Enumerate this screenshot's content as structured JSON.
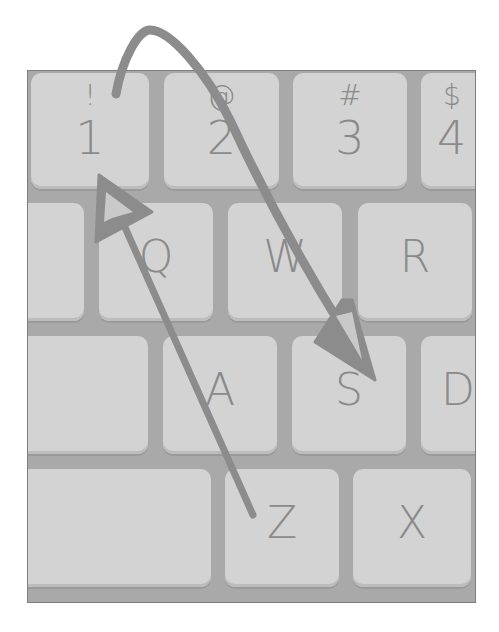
{
  "colors": {
    "frame": "#a9a9a9",
    "key": "#d3d3d3",
    "legend": "#8a8a8a",
    "arrow": "#8c8c8c"
  },
  "keyboard": {
    "rows": [
      {
        "keys": [
          {
            "id": "key-1",
            "top": "!",
            "main": "1"
          },
          {
            "id": "key-2",
            "top": "@",
            "main": "2"
          },
          {
            "id": "key-3",
            "top": "#",
            "main": "3"
          },
          {
            "id": "key-4",
            "top": "$",
            "main": "4"
          }
        ]
      },
      {
        "keys": [
          {
            "id": "key-tab",
            "label": ""
          },
          {
            "id": "key-q",
            "label": "Q"
          },
          {
            "id": "key-w",
            "label": "W"
          },
          {
            "id": "key-r",
            "label": "R"
          }
        ]
      },
      {
        "keys": [
          {
            "id": "key-caps",
            "label": ""
          },
          {
            "id": "key-a",
            "label": "A"
          },
          {
            "id": "key-s",
            "label": "S"
          },
          {
            "id": "key-d",
            "label": "D"
          }
        ]
      },
      {
        "keys": [
          {
            "id": "key-shift",
            "label": ""
          },
          {
            "id": "key-z",
            "label": "Z"
          },
          {
            "id": "key-x",
            "label": "X"
          }
        ]
      }
    ]
  },
  "annotations": {
    "arrow_1": "curved arrow from key 1 over key 2 to key S",
    "arrow_2": "straight arrow from key Z up to key 1"
  }
}
